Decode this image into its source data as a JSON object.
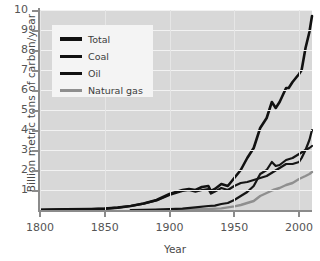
{
  "chart_data": {
    "type": "line",
    "title": "",
    "xlabel": "Year",
    "ylabel": "Billion metric tons of carbon/year",
    "xlim": [
      1800,
      2010
    ],
    "ylim": [
      0,
      10
    ],
    "xticks": [
      1800,
      1850,
      1900,
      1950,
      2000
    ],
    "yticks": [
      1,
      2,
      3,
      4,
      5,
      6,
      7,
      8,
      9,
      10
    ],
    "grid": "horizontal-white",
    "legend_position": "upper-left-inside",
    "series": [
      {
        "name": "Total",
        "color": "#111111",
        "width": 2.6,
        "x": [
          1800,
          1820,
          1840,
          1850,
          1860,
          1870,
          1880,
          1890,
          1900,
          1910,
          1915,
          1920,
          1925,
          1930,
          1932,
          1935,
          1940,
          1945,
          1950,
          1955,
          1960,
          1965,
          1970,
          1975,
          1979,
          1982,
          1985,
          1990,
          1992,
          1995,
          2000,
          2002,
          2005,
          2008,
          2010
        ],
        "y": [
          0.01,
          0.03,
          0.05,
          0.07,
          0.12,
          0.2,
          0.33,
          0.5,
          0.8,
          1.0,
          1.05,
          1.0,
          1.15,
          1.2,
          0.95,
          1.05,
          1.3,
          1.2,
          1.6,
          2.0,
          2.6,
          3.1,
          4.1,
          4.6,
          5.4,
          5.1,
          5.4,
          6.1,
          6.1,
          6.4,
          6.8,
          7.0,
          8.1,
          8.9,
          9.7
        ]
      },
      {
        "name": "Coal",
        "color": "#151515",
        "width": 2.2,
        "x": [
          1800,
          1820,
          1840,
          1850,
          1860,
          1870,
          1880,
          1890,
          1900,
          1910,
          1915,
          1920,
          1925,
          1930,
          1932,
          1935,
          1940,
          1945,
          1950,
          1955,
          1960,
          1965,
          1970,
          1975,
          1980,
          1985,
          1990,
          1995,
          2000,
          2002,
          2005,
          2008,
          2010
        ],
        "y": [
          0.01,
          0.03,
          0.05,
          0.07,
          0.12,
          0.2,
          0.32,
          0.48,
          0.75,
          0.95,
          1.0,
          0.92,
          1.0,
          1.05,
          0.82,
          0.92,
          1.1,
          1.0,
          1.2,
          1.35,
          1.4,
          1.5,
          1.6,
          1.7,
          1.9,
          2.1,
          2.3,
          2.3,
          2.4,
          2.6,
          3.0,
          3.5,
          4.0
        ]
      },
      {
        "name": "Oil",
        "color": "#151515",
        "width": 2.2,
        "x": [
          1870,
          1880,
          1890,
          1900,
          1910,
          1920,
          1930,
          1935,
          1940,
          1945,
          1950,
          1955,
          1960,
          1965,
          1970,
          1975,
          1979,
          1982,
          1985,
          1990,
          1995,
          2000,
          2005,
          2008,
          2010
        ],
        "y": [
          0.0,
          0.01,
          0.02,
          0.04,
          0.07,
          0.13,
          0.2,
          0.22,
          0.3,
          0.35,
          0.5,
          0.7,
          0.9,
          1.2,
          1.8,
          2.0,
          2.4,
          2.2,
          2.25,
          2.5,
          2.6,
          2.8,
          3.0,
          3.1,
          3.2
        ]
      },
      {
        "name": "Natural gas",
        "color": "#8f8f8f",
        "width": 2.4,
        "x": [
          1890,
          1900,
          1910,
          1920,
          1930,
          1940,
          1950,
          1955,
          1960,
          1965,
          1970,
          1975,
          1980,
          1985,
          1990,
          1995,
          2000,
          2005,
          2008,
          2010
        ],
        "y": [
          0.0,
          0.01,
          0.02,
          0.03,
          0.05,
          0.08,
          0.18,
          0.25,
          0.35,
          0.45,
          0.7,
          0.85,
          1.0,
          1.1,
          1.25,
          1.35,
          1.55,
          1.7,
          1.8,
          1.9
        ]
      }
    ]
  },
  "axes": {
    "ylabel": "Billion metric tons of carbon/year",
    "xlabel": "Year",
    "yticklabels": [
      "10",
      "9",
      "8",
      "7",
      "6",
      "5",
      "4",
      "3",
      "2",
      "1"
    ],
    "xticklabels": [
      "1800",
      "1850",
      "1900",
      "1950",
      "2000"
    ]
  },
  "legend": {
    "items": [
      {
        "label": "Total"
      },
      {
        "label": "Coal"
      },
      {
        "label": "Oil"
      },
      {
        "label": "Natural gas"
      }
    ]
  },
  "colors": {
    "plot_background": "#d8d8d8",
    "gridline": "#f2f2f2",
    "axis": "#8b8b8b",
    "series_dark": "#111111",
    "series_gray": "#8f8f8f",
    "legend_background": "#f4f4f4",
    "text": "#4a4a4a"
  }
}
